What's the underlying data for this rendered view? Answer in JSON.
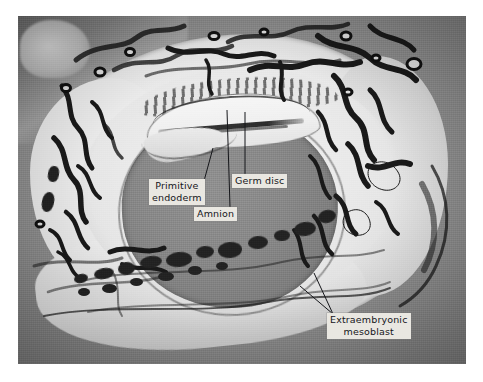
{
  "figure": {
    "kind": "histological-photomicrograph",
    "medium": "black-and-white halftone photographic plate",
    "border_color": "#ffffff",
    "plate": {
      "left": 18,
      "top": 16,
      "width": 448,
      "height": 348,
      "base_tone": "#8e8e8e",
      "tones": {
        "pale_tissue": "#ece8e0",
        "mid_ground": "#8c8c8c",
        "dark_strands": "#1d1d1d",
        "cavity": "#868686"
      }
    }
  },
  "labels": [
    {
      "id": "primitive-endoderm",
      "text_lines": [
        "Primitive",
        "endoderm"
      ],
      "text": "Primitive endoderm",
      "box": {
        "left": 149,
        "top": 179,
        "width": 55,
        "height": 25
      },
      "leader": {
        "x1": 204,
        "y1": 181,
        "x2": 212,
        "y2": 149
      }
    },
    {
      "id": "germ-disc",
      "text_lines": [
        "Germ disc"
      ],
      "text": "Germ disc",
      "box": {
        "left": 232,
        "top": 174,
        "width": 58,
        "height": 13
      },
      "leader": {
        "x1": 244,
        "y1": 174,
        "x2": 244,
        "y2": 112
      }
    },
    {
      "id": "amnion",
      "text_lines": [
        "Amnion"
      ],
      "text": "Amnion",
      "box": {
        "left": 194,
        "top": 207,
        "width": 45,
        "height": 13
      },
      "leader": {
        "x1": 230,
        "y1": 207,
        "x2": 228,
        "y2": 110
      }
    },
    {
      "id": "extraembryonic-mesoblast",
      "text_lines": [
        "Extraembryonic",
        "mesoblast"
      ],
      "text": "Extraembryonic mesoblast",
      "box": {
        "left": 327,
        "top": 313,
        "width": 84,
        "height": 25
      },
      "leader": {
        "x1": 333,
        "y1": 315,
        "x2": 312,
        "y2": 277
      }
    }
  ],
  "anatomy_features": [
    {
      "name": "chorionic-wall",
      "description": "pale ring of chorionic mesoblast surrounding the cavity"
    },
    {
      "name": "trophoblast-strands",
      "description": "dark branching trophoblastic and vascular strands in the upper decidua"
    },
    {
      "name": "maternal-vessels",
      "description": "small ring-shaped vessel profiles in the decidual field"
    },
    {
      "name": "exocoelomic-cavity",
      "description": "large mid-grey central cavity"
    },
    {
      "name": "amniotic-vesicle",
      "description": "pale arched vesicle in the upper part of the cavity"
    },
    {
      "name": "germ-disc-plate",
      "description": "thin dark horizontal plate beneath the amnion"
    },
    {
      "name": "reticular-mesoblast",
      "description": "vacuolated reticular tissue along the lower wall"
    }
  ]
}
